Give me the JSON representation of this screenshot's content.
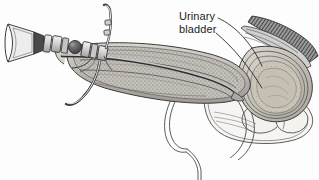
{
  "figure": {
    "background_color": "#fdfdfd",
    "ink_color": "#3a3a3a",
    "label_color": "#1c1c1c"
  },
  "labels": [
    {
      "id": "urinary-bladder",
      "line1": "Urinary",
      "line2": "bladder",
      "leader_count": 2
    }
  ],
  "anatomy": {
    "bladder": {
      "name": "urinary bladder",
      "fill": "#cfc9bd",
      "wall_layers": 5
    },
    "penile_shaft": {
      "name": "penile shaft with urethra",
      "fill": "#bdbdbd",
      "texture": "stipple"
    },
    "pubic_bone": {
      "name": "pubic bone hatching",
      "fill": "#5a5a5a",
      "texture": "diagonal-hatch"
    },
    "scrotum": {
      "name": "scrotum and testis",
      "fill": "#f4f4f4"
    },
    "rectum": {
      "name": "rectum outline",
      "fill": "#fafafa"
    }
  },
  "instrument": {
    "name": "cystoscope",
    "parts": [
      {
        "id": "eyepiece",
        "name": "eyepiece funnel",
        "fill": "#e8e8e8"
      },
      {
        "id": "collar",
        "name": "eyepiece collar",
        "fill": "#d0d0d0"
      },
      {
        "id": "barrel",
        "name": "segmented barrel",
        "fill": "#d8d8d8"
      },
      {
        "id": "stopcock-knob",
        "name": "stopcock valve knob",
        "fill": "#5f5f5f"
      },
      {
        "id": "irrigation-tube",
        "name": "irrigation inflow tube",
        "fill": "#eeeeee"
      },
      {
        "id": "drainage-tube",
        "name": "drainage outflow tube",
        "fill": "#eeeeee"
      },
      {
        "id": "sheath",
        "name": "scope sheath in urethra",
        "fill": "#c8c8c8"
      }
    ]
  }
}
